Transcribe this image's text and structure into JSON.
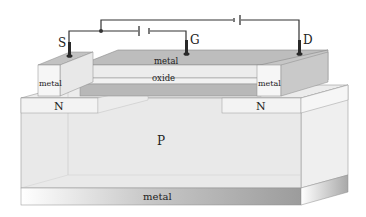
{
  "diagram": {
    "type": "MOSFET cross-section",
    "terminals": {
      "source": "S",
      "gate": "G",
      "drain": "D"
    },
    "layers": {
      "gate_metal": "metal",
      "gate_oxide": "oxide",
      "source_contact": "metal",
      "drain_contact": "metal",
      "source_region": "N",
      "drain_region": "N",
      "substrate": "P",
      "bottom_contact": "metal"
    },
    "colors": {
      "light_face": "#f1f1f1",
      "mid_face": "#d9d9d9",
      "dark_face": "#b3b3b3",
      "wire": "#333333",
      "outline": "#8a8a8a"
    }
  }
}
